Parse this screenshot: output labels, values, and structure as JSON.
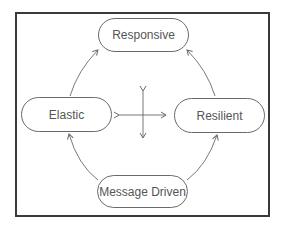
{
  "diagram": {
    "nodes": [
      {
        "id": "responsive",
        "label": "Responsive"
      },
      {
        "id": "elastic",
        "label": "Elastic"
      },
      {
        "id": "resilient",
        "label": "Resilient"
      },
      {
        "id": "message_driven",
        "label": "Message Driven"
      }
    ],
    "edges": [
      {
        "from": "elastic",
        "to": "responsive"
      },
      {
        "from": "resilient",
        "to": "responsive"
      },
      {
        "from": "message_driven",
        "to": "elastic"
      },
      {
        "from": "message_driven",
        "to": "resilient"
      }
    ],
    "center_symbol": "four-way-arrow",
    "colors": {
      "line": "#6a6a6a",
      "frame": "#3a3a3a",
      "text": "#555555"
    }
  }
}
